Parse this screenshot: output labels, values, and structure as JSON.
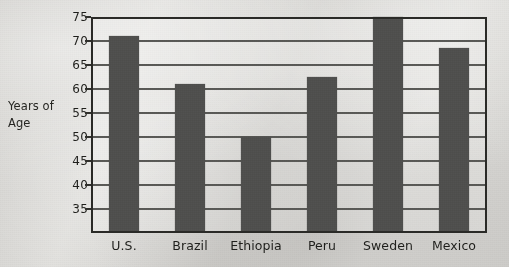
{
  "chart_data": {
    "type": "bar",
    "title": "",
    "subtitle": "",
    "xlabel": "",
    "ylabel": "Years of Age",
    "ylabel_lines": [
      "Years of",
      "Age"
    ],
    "categories": [
      "U.S.",
      "Brazil",
      "Ethiopia",
      "Peru",
      "Sweden",
      "Mexico"
    ],
    "values": [
      71,
      61,
      50,
      62.5,
      75,
      68.5
    ],
    "series": [
      {
        "name": "Years of Age",
        "values": [
          71,
          61,
          50,
          62.5,
          75,
          68.5
        ]
      }
    ],
    "yticks": [
      75,
      70,
      65,
      60,
      55,
      50,
      45,
      40,
      35
    ],
    "ytick_labels": [
      "75",
      "70",
      "65",
      "60",
      "55",
      "50",
      "45",
      "40",
      "35"
    ],
    "ylim": [
      30,
      75
    ],
    "axis_baseline": 30,
    "grid": true,
    "grid_axis": "y",
    "legend": false,
    "legend_position": "none",
    "bar_color": "#222220",
    "axis_color": "#2a2a26",
    "text_color": "#1d1d19",
    "background_color": "#dcdbd7"
  }
}
